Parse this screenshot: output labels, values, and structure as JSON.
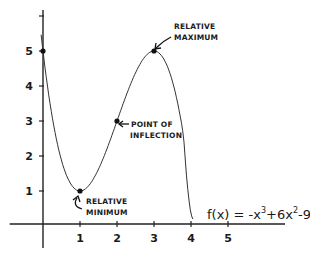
{
  "chart_data": {
    "type": "line",
    "title": "",
    "xlabel": "",
    "ylabel": "",
    "function": "f(x) = -x^3 + 6x^2 - 9x + 5",
    "formula_label": {
      "prefix": "f(x) = -x",
      "exp1": "3",
      "mid1": "+6x",
      "exp2": "2",
      "suffix": "-9x+5"
    },
    "x_ticks": [
      1,
      2,
      3,
      4,
      5
    ],
    "x_tick_labels": [
      "1",
      "2",
      "3",
      "4",
      "5"
    ],
    "y_ticks": [
      1,
      2,
      3,
      4,
      5,
      6
    ],
    "y_tick_labels": [
      "1",
      "2",
      "3",
      "4",
      "5",
      ""
    ],
    "xlim": [
      -0.9,
      6.5
    ],
    "ylim": [
      -1.0,
      6.3
    ],
    "grid": false,
    "legend": "none",
    "series": [
      {
        "name": "f(x)",
        "x": [
          -0.05,
          0,
          0.25,
          0.5,
          0.75,
          1,
          1.25,
          1.5,
          1.75,
          2,
          2.25,
          2.5,
          2.75,
          3,
          3.25,
          3.5,
          3.75,
          4.05
        ],
        "y": [
          5.47,
          5,
          3.05,
          1.88,
          1.23,
          1,
          1.13,
          1.63,
          2.27,
          3,
          3.73,
          4.38,
          4.86,
          5,
          4.61,
          3.63,
          2.27,
          0.2
        ]
      }
    ],
    "points": [
      {
        "name": "y-intercept",
        "x": 0,
        "y": 5,
        "label": ""
      },
      {
        "name": "relative-minimum",
        "x": 1,
        "y": 1,
        "label_lines": [
          "RELATIVE",
          "MINIMUM"
        ]
      },
      {
        "name": "point-of-inflection",
        "x": 2,
        "y": 3,
        "label_lines": [
          "POINT OF",
          "INFLECTION"
        ]
      },
      {
        "name": "relative-maximum",
        "x": 3,
        "y": 5,
        "label_lines": [
          "RELATIVE",
          "MAXIMUM"
        ]
      }
    ]
  }
}
